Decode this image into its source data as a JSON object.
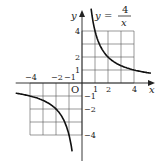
{
  "chart_data": {
    "type": "line",
    "equation": {
      "lhs": "y",
      "eq": "=",
      "numerator": "4",
      "denominator": "x"
    },
    "xlabel": "x",
    "ylabel": "y",
    "origin_label": "O",
    "xlim": [
      -5.1,
      5.6
    ],
    "ylim": [
      -5.1,
      5.6
    ],
    "grid": true,
    "grid_regions": [
      {
        "x": [
          0,
          4
        ],
        "y": [
          0,
          4
        ]
      },
      {
        "x": [
          -4,
          0
        ],
        "y": [
          -4,
          0
        ]
      }
    ],
    "x_ticks": [
      {
        "value": -4,
        "label": "−4"
      },
      {
        "value": -2,
        "label": "−2"
      },
      {
        "value": -1,
        "label": "−1"
      },
      {
        "value": 1,
        "label": "1"
      },
      {
        "value": 2,
        "label": "2"
      },
      {
        "value": 4,
        "label": "4"
      }
    ],
    "y_ticks": [
      {
        "value": 4,
        "label": "4"
      },
      {
        "value": 2,
        "label": "2"
      },
      {
        "value": 1,
        "label": "1"
      },
      {
        "value": -1,
        "label": "−1"
      },
      {
        "value": -2,
        "label": "−2"
      },
      {
        "value": -4,
        "label": "−4"
      }
    ],
    "series": [
      {
        "name": "y=4/x (x>0)",
        "x": [
          0.7,
          1,
          1.5,
          2,
          3,
          4,
          5.1
        ],
        "y": [
          5.71,
          4,
          2.67,
          2,
          1.33,
          1,
          0.78
        ]
      },
      {
        "name": "y=4/x (x<0)",
        "x": [
          -5.1,
          -4,
          -3,
          -2,
          -1.5,
          -1,
          -0.77
        ],
        "y": [
          -0.78,
          -1,
          -1.33,
          -2,
          -2.67,
          -4,
          -5.2
        ]
      }
    ]
  }
}
